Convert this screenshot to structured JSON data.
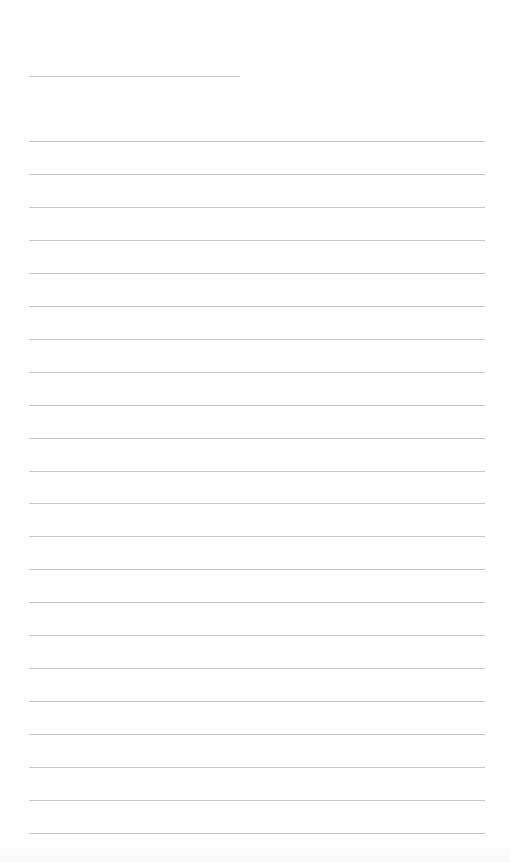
{
  "document": {
    "type": "ruled-paper",
    "header_line": {
      "label": ""
    },
    "ruled_lines": [
      {
        "text": ""
      },
      {
        "text": ""
      },
      {
        "text": ""
      },
      {
        "text": ""
      },
      {
        "text": ""
      },
      {
        "text": ""
      },
      {
        "text": ""
      },
      {
        "text": ""
      },
      {
        "text": ""
      },
      {
        "text": ""
      },
      {
        "text": ""
      },
      {
        "text": ""
      },
      {
        "text": ""
      },
      {
        "text": ""
      },
      {
        "text": ""
      },
      {
        "text": ""
      },
      {
        "text": ""
      },
      {
        "text": ""
      },
      {
        "text": ""
      },
      {
        "text": ""
      },
      {
        "text": ""
      },
      {
        "text": ""
      }
    ],
    "line_color": "#bdbdbd",
    "background_color": "#fefefe"
  }
}
